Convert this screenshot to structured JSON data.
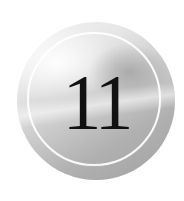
{
  "badge": {
    "number": "11",
    "colors": {
      "background": "#ffffff",
      "badge_light": "#f4f4f4",
      "badge_dark": "#a2a2a2",
      "ring": "#ffffff",
      "number": "#111111"
    }
  }
}
